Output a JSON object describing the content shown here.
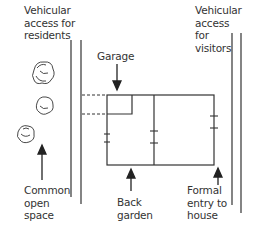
{
  "diagram": {
    "type": "site-plan",
    "labels": {
      "resident_access": "Vehicular\naccess for\nresidents",
      "visitor_access": "Vehicular\naccess\nfor\nvisitors",
      "garage": "Garage",
      "common_open_space": "Common\nopen\nspace",
      "back_garden": "Back\ngarden",
      "formal_entry": "Formal\nentry to\nhouse"
    },
    "colors": {
      "line": "#222222",
      "text": "#333333",
      "background": "#ffffff"
    }
  }
}
